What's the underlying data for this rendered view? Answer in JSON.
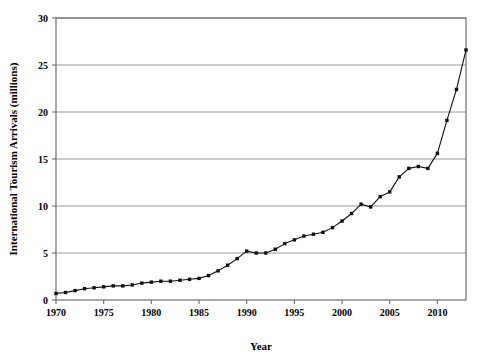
{
  "chart_data": {
    "type": "line",
    "title": "",
    "xlabel": "Year",
    "ylabel": "International Tourism Arrivals (millions)",
    "xlim": [
      1970,
      2013
    ],
    "ylim": [
      0,
      30
    ],
    "xticks": [
      1970,
      1975,
      1980,
      1985,
      1990,
      1995,
      2000,
      2005,
      2010
    ],
    "yticks": [
      0,
      5,
      10,
      15,
      20,
      25,
      30
    ],
    "grid": "horizontal",
    "legend": "none",
    "marker": "filled-square",
    "x": [
      1970,
      1971,
      1972,
      1973,
      1974,
      1975,
      1976,
      1977,
      1978,
      1979,
      1980,
      1981,
      1982,
      1983,
      1984,
      1985,
      1986,
      1987,
      1988,
      1989,
      1990,
      1991,
      1992,
      1993,
      1994,
      1995,
      1996,
      1997,
      1998,
      1999,
      2000,
      2001,
      2002,
      2003,
      2004,
      2005,
      2006,
      2007,
      2008,
      2009,
      2010,
      2011,
      2012,
      2013
    ],
    "values": [
      0.7,
      0.8,
      1.0,
      1.2,
      1.3,
      1.4,
      1.5,
      1.5,
      1.6,
      1.8,
      1.9,
      2.0,
      2.0,
      2.1,
      2.2,
      2.3,
      2.6,
      3.1,
      3.7,
      4.4,
      5.2,
      5.0,
      5.0,
      5.4,
      6.0,
      6.4,
      6.8,
      7.0,
      7.2,
      7.7,
      8.4,
      9.2,
      10.2,
      9.9,
      11.0,
      11.5,
      13.1,
      14.0,
      14.2,
      14.0,
      15.6,
      19.1,
      22.4,
      26.6
    ],
    "notes": {
      "trend": "steady gradual growth 1970-1985, accelerating growth from 1986, plateau 1990-1992, dip in 2003, dip in 2009, sharp rise 2010-2013",
      "peak_value": 26.6,
      "peak_year": 2013,
      "start_value": 0.7,
      "start_year": 1970
    }
  },
  "colors": {
    "line": "#111111",
    "marker": "#111111",
    "grid": "#9a9a9a",
    "frame": "#6f6f6f",
    "background": "#ffffff",
    "text": "#000000"
  },
  "axis": {
    "x_title": "Year",
    "y_title": "International Tourism Arrivals (millions)"
  },
  "ticklabels": {
    "x": [
      "1970",
      "1975",
      "1980",
      "1985",
      "1990",
      "1995",
      "2000",
      "2005",
      "2010"
    ],
    "y": [
      "0",
      "5",
      "10",
      "15",
      "20",
      "25",
      "30"
    ]
  }
}
